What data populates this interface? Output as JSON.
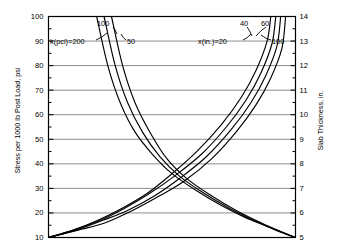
{
  "chart_data": {
    "type": "line",
    "title": "",
    "subtitle": "",
    "xlabel": "",
    "ylabel": "Stress per 1000 lb Post Load, psi",
    "ylabel_right": "Slab Thickness, in.",
    "ylim": [
      10,
      100
    ],
    "ylim_right": [
      5,
      14
    ],
    "yticks": [
      10,
      20,
      30,
      40,
      50,
      60,
      70,
      80,
      90,
      100
    ],
    "yticks_right": [
      5,
      6,
      7,
      8,
      9,
      10,
      11,
      12,
      13,
      14
    ],
    "ytick_minor_step": 5,
    "ytick_right_minor_step": 0.5,
    "grid": true,
    "grid_axis": "y",
    "legend_position": "inline-annotations",
    "xaxis_visible": false,
    "annotations": [
      {
        "text": "k(pci)=200",
        "family": "k"
      },
      {
        "text": "100",
        "family": "k"
      },
      {
        "text": "50",
        "family": "k"
      },
      {
        "text": "x(in.)=20",
        "family": "x"
      },
      {
        "text": "40",
        "family": "x"
      },
      {
        "text": "60",
        "family": "x"
      },
      {
        "text": "100",
        "family": "x"
      }
    ],
    "series": [
      {
        "name": "k(pci)=200",
        "family": "k",
        "trend": "decreasing",
        "points": [
          [
            0.195,
            100
          ],
          [
            0.24,
            80
          ],
          [
            0.29,
            65
          ],
          [
            0.35,
            53
          ],
          [
            0.42,
            44
          ],
          [
            0.5,
            36
          ],
          [
            0.6,
            29
          ],
          [
            0.7,
            23
          ],
          [
            0.8,
            18
          ],
          [
            0.9,
            14
          ],
          [
            1.0,
            10
          ]
        ]
      },
      {
        "name": "k(pci)=100",
        "family": "k",
        "trend": "decreasing",
        "points": [
          [
            0.225,
            100
          ],
          [
            0.27,
            80
          ],
          [
            0.32,
            65
          ],
          [
            0.38,
            53
          ],
          [
            0.45,
            43
          ],
          [
            0.53,
            35
          ],
          [
            0.63,
            28
          ],
          [
            0.73,
            22
          ],
          [
            0.83,
            17
          ],
          [
            0.92,
            13
          ],
          [
            1.0,
            10
          ]
        ]
      },
      {
        "name": "k(pci)=50",
        "family": "k",
        "trend": "decreasing",
        "points": [
          [
            0.255,
            100
          ],
          [
            0.3,
            80
          ],
          [
            0.35,
            65
          ],
          [
            0.41,
            53
          ],
          [
            0.48,
            42
          ],
          [
            0.56,
            34
          ],
          [
            0.66,
            27
          ],
          [
            0.76,
            21
          ],
          [
            0.86,
            16
          ],
          [
            0.95,
            12
          ],
          [
            1.0,
            10
          ]
        ]
      },
      {
        "name": "x(in.)=20",
        "family": "x",
        "trend": "increasing",
        "points": [
          [
            0.0,
            10
          ],
          [
            0.1,
            13
          ],
          [
            0.2,
            17
          ],
          [
            0.3,
            22
          ],
          [
            0.4,
            28
          ],
          [
            0.5,
            36
          ],
          [
            0.6,
            45
          ],
          [
            0.7,
            56
          ],
          [
            0.78,
            67
          ],
          [
            0.84,
            78
          ],
          [
            0.885,
            90
          ],
          [
            0.9,
            100
          ]
        ]
      },
      {
        "name": "x(in.)=40",
        "family": "x",
        "trend": "increasing",
        "points": [
          [
            0.0,
            10
          ],
          [
            0.1,
            13
          ],
          [
            0.21,
            17
          ],
          [
            0.31,
            22
          ],
          [
            0.41,
            28
          ],
          [
            0.51,
            35
          ],
          [
            0.62,
            44
          ],
          [
            0.72,
            55
          ],
          [
            0.8,
            66
          ],
          [
            0.86,
            77
          ],
          [
            0.905,
            89
          ],
          [
            0.92,
            100
          ]
        ]
      },
      {
        "name": "x(in.)=60",
        "family": "x",
        "trend": "increasing",
        "points": [
          [
            0.0,
            10
          ],
          [
            0.11,
            13
          ],
          [
            0.22,
            17
          ],
          [
            0.32,
            21
          ],
          [
            0.43,
            27
          ],
          [
            0.53,
            34
          ],
          [
            0.64,
            43
          ],
          [
            0.74,
            54
          ],
          [
            0.82,
            65
          ],
          [
            0.88,
            76
          ],
          [
            0.925,
            88
          ],
          [
            0.94,
            100
          ]
        ]
      },
      {
        "name": "x(in.)=100",
        "family": "x",
        "trend": "increasing",
        "points": [
          [
            0.0,
            10
          ],
          [
            0.12,
            13
          ],
          [
            0.23,
            16
          ],
          [
            0.34,
            21
          ],
          [
            0.45,
            27
          ],
          [
            0.55,
            33
          ],
          [
            0.66,
            42
          ],
          [
            0.76,
            53
          ],
          [
            0.84,
            64
          ],
          [
            0.9,
            75
          ],
          [
            0.945,
            87
          ],
          [
            0.96,
            100
          ]
        ]
      }
    ],
    "crossing_point": {
      "y": 41,
      "note": "families intersect near 41 psi"
    }
  },
  "colors": {
    "curve": "#000000",
    "grid": "#808080",
    "frame": "#000000",
    "background": "#ffffff",
    "text": "#000000"
  }
}
